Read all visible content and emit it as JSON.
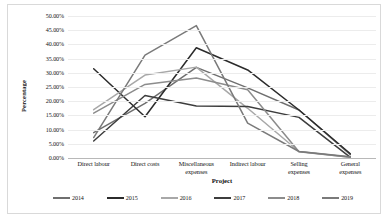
{
  "chart_data": {
    "type": "line",
    "title": "",
    "xlabel": "Project",
    "ylabel": "Percentage",
    "ylim": [
      0,
      50
    ],
    "ytick_step": 5,
    "grid": true,
    "legend_position": "bottom",
    "categories": [
      "Direct labour",
      "Direct costs",
      "Miscellaneous expenses",
      "Indirect labour",
      "Selling expenses",
      "General expenses"
    ],
    "category_lines": [
      [
        "Direct labour"
      ],
      [
        "Direct costs"
      ],
      [
        "Miscellaneous",
        "expenses"
      ],
      [
        "Indirect labour"
      ],
      [
        "Selling",
        "expenses"
      ],
      [
        "General",
        "expenses"
      ]
    ],
    "ytick_labels": [
      "50.00%",
      "45.00%",
      "40.00%",
      "35.00%",
      "30.00%",
      "25.00%",
      "20.00%",
      "15.00%",
      "10.00%",
      "5.00%",
      "0.00%"
    ],
    "ytick_values": [
      50,
      45,
      40,
      35,
      30,
      25,
      20,
      15,
      10,
      5,
      0
    ],
    "series": [
      {
        "name": "2014",
        "color": "#6f6f6f",
        "width": 1.5,
        "values": [
          8.9,
          19.2,
          31.9,
          24.7,
          16.9,
          1.2
        ]
      },
      {
        "name": "2015",
        "color": "#2b2b2b",
        "width": 1.5,
        "values": [
          31.4,
          14.5,
          38.8,
          31.0,
          16.9,
          1.5
        ]
      },
      {
        "name": "2016",
        "color": "#a8a8a8",
        "width": 1.5,
        "values": [
          17.0,
          29.2,
          32.0,
          17.5,
          2.3,
          0.3
        ]
      },
      {
        "name": "2017",
        "color": "#3d3d3d",
        "width": 1.5,
        "values": [
          6.0,
          22.0,
          18.3,
          18.1,
          14.3,
          0.2
        ]
      },
      {
        "name": "2018",
        "color": "#8c8c8c",
        "width": 1.5,
        "values": [
          15.8,
          25.9,
          28.2,
          24.0,
          2.2,
          0.3
        ]
      },
      {
        "name": "2019",
        "color": "#7a7a7a",
        "width": 1.5,
        "values": [
          7.2,
          36.2,
          46.6,
          12.3,
          2.3,
          0.4
        ]
      }
    ]
  }
}
